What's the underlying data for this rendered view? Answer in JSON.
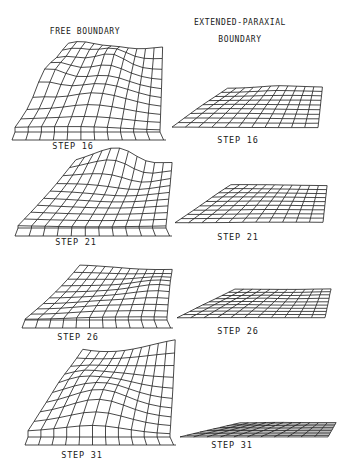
{
  "figure": {
    "columns": [
      {
        "title_lines": [
          "FREE BOUNDARY"
        ],
        "x": 85,
        "y": 27
      },
      {
        "title_lines": [
          "EXTENDED-PARAXIAL",
          "BOUNDARY"
        ],
        "x": 240,
        "y": 14
      }
    ],
    "panels": [
      {
        "column": "free",
        "label": "STEP 16",
        "label_x": 73,
        "label_y": 141,
        "ox": 15,
        "oy": 132,
        "w": 145,
        "depth": 58,
        "skew": 28,
        "amp": 34,
        "wall": 1,
        "seed": 1
      },
      {
        "column": "paraxial",
        "label": "STEP 16",
        "label_x": 238,
        "label_y": 135,
        "ox": 172,
        "oy": 128,
        "w": 146,
        "depth": 38,
        "skew": 30,
        "amp": 4,
        "wall": 0,
        "seed": 2
      },
      {
        "column": "free",
        "label": "STEP 21",
        "label_x": 76,
        "label_y": 237,
        "ox": 18,
        "oy": 228,
        "w": 148,
        "depth": 52,
        "skew": 32,
        "amp": 22,
        "wall": 0.3,
        "seed": 3
      },
      {
        "column": "paraxial",
        "label": "STEP 21",
        "label_x": 238,
        "label_y": 232,
        "ox": 175,
        "oy": 223,
        "w": 148,
        "depth": 36,
        "skew": 30,
        "amp": 3,
        "wall": 0,
        "seed": 4
      },
      {
        "column": "free",
        "label": "STEP 26",
        "label_x": 78,
        "label_y": 332,
        "ox": 25,
        "oy": 320,
        "w": 142,
        "depth": 42,
        "skew": 30,
        "amp": 16,
        "wall": 0.2,
        "seed": 5
      },
      {
        "column": "paraxial",
        "label": "STEP 26",
        "label_x": 238,
        "label_y": 326,
        "ox": 177,
        "oy": 318,
        "w": 148,
        "depth": 28,
        "skew": 32,
        "amp": 1.5,
        "wall": 0,
        "seed": 6
      },
      {
        "column": "free",
        "label": "STEP 31",
        "label_x": 82,
        "label_y": 450,
        "ox": 28,
        "oy": 437,
        "w": 142,
        "depth": 62,
        "skew": 30,
        "amp": 46,
        "wall": 1.2,
        "seed": 7
      },
      {
        "column": "paraxial",
        "label": "STEP 31",
        "label_x": 232,
        "label_y": 440,
        "ox": 180,
        "oy": 437,
        "w": 148,
        "depth": 14,
        "skew": 34,
        "amp": 0.6,
        "wall": 0,
        "seed": 8
      }
    ],
    "grid": {
      "cols": 11,
      "rows": 9,
      "stroke": "#1a1a1a"
    }
  }
}
